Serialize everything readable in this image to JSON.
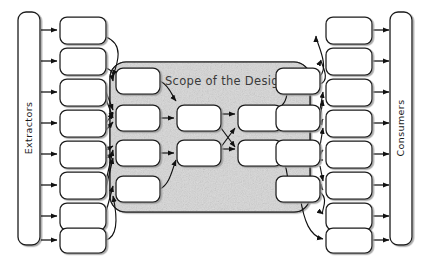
{
  "diagram": {
    "title": "Scope of the Design",
    "background_color": "#ffffff",
    "stroke_color": "#1a1a1a",
    "scope_fill_color": "#e2e2e2",
    "box_fill_color": "#ffffff",
    "left_bar": {
      "label": "Extractors",
      "orientation": "vertical",
      "x": 18,
      "y": 12,
      "width": 22,
      "height": 233
    },
    "right_bar": {
      "label": "Consumers",
      "orientation": "vertical",
      "x": 390,
      "y": 12,
      "width": 22,
      "height": 233
    },
    "scope_region": {
      "label": "Scope of the Design",
      "x": 110,
      "y": 62,
      "width": 200,
      "height": 150,
      "corner_radius": 16
    },
    "left_column": {
      "name": "extractor-boxes",
      "count": 8,
      "boxes": [
        {
          "x": 60,
          "y": 17,
          "w": 46,
          "h": 27
        },
        {
          "x": 60,
          "y": 48,
          "w": 46,
          "h": 27
        },
        {
          "x": 60,
          "y": 79,
          "w": 46,
          "h": 27
        },
        {
          "x": 60,
          "y": 110,
          "w": 46,
          "h": 27
        },
        {
          "x": 60,
          "y": 141,
          "w": 46,
          "h": 27
        },
        {
          "x": 60,
          "y": 172,
          "w": 46,
          "h": 27
        },
        {
          "x": 60,
          "y": 203,
          "w": 46,
          "h": 27
        },
        {
          "x": 60,
          "y": 228,
          "w": 46,
          "h": 25
        }
      ]
    },
    "right_column": {
      "name": "consumer-boxes",
      "count": 8,
      "boxes": [
        {
          "x": 326,
          "y": 17,
          "w": 46,
          "h": 27
        },
        {
          "x": 326,
          "y": 48,
          "w": 46,
          "h": 27
        },
        {
          "x": 326,
          "y": 79,
          "w": 46,
          "h": 27
        },
        {
          "x": 326,
          "y": 110,
          "w": 46,
          "h": 27
        },
        {
          "x": 326,
          "y": 141,
          "w": 46,
          "h": 27
        },
        {
          "x": 326,
          "y": 172,
          "w": 46,
          "h": 27
        },
        {
          "x": 326,
          "y": 203,
          "w": 46,
          "h": 27
        },
        {
          "x": 326,
          "y": 228,
          "w": 46,
          "h": 25
        }
      ]
    },
    "inner_columns": [
      {
        "name": "inner-column-1",
        "count": 4,
        "boxes": [
          {
            "x": 116,
            "y": 68,
            "w": 44,
            "h": 26
          },
          {
            "x": 116,
            "y": 105,
            "w": 44,
            "h": 26
          },
          {
            "x": 116,
            "y": 140,
            "w": 44,
            "h": 26
          },
          {
            "x": 116,
            "y": 176,
            "w": 44,
            "h": 26
          }
        ]
      },
      {
        "name": "inner-column-2",
        "count": 2,
        "boxes": [
          {
            "x": 177,
            "y": 105,
            "w": 44,
            "h": 26
          },
          {
            "x": 177,
            "y": 140,
            "w": 44,
            "h": 26
          }
        ]
      },
      {
        "name": "inner-column-3",
        "count": 2,
        "boxes": [
          {
            "x": 238,
            "y": 105,
            "w": 44,
            "h": 26
          },
          {
            "x": 238,
            "y": 140,
            "w": 44,
            "h": 26
          }
        ]
      },
      {
        "name": "inner-column-4",
        "count": 4,
        "boxes": [
          {
            "x": 276,
            "y": 68,
            "w": 44,
            "h": 26
          },
          {
            "x": 276,
            "y": 105,
            "w": 44,
            "h": 26
          },
          {
            "x": 276,
            "y": 140,
            "w": 44,
            "h": 26
          },
          {
            "x": 276,
            "y": 176,
            "w": 44,
            "h": 26
          }
        ]
      }
    ]
  }
}
